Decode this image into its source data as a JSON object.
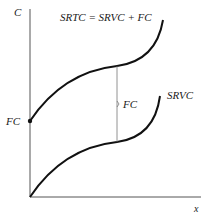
{
  "diagram": {
    "axes": {
      "y_label": "C",
      "x_label": "x"
    },
    "curves": {
      "srtc_label": "SRTC = SRVC + FC",
      "srvc_label": "SRVC"
    },
    "annotations": {
      "intercept_label": "FC",
      "gap_label": "FC"
    },
    "colors": {
      "curve": "#111111",
      "axis": "#555555",
      "gap_line": "#777777"
    }
  }
}
